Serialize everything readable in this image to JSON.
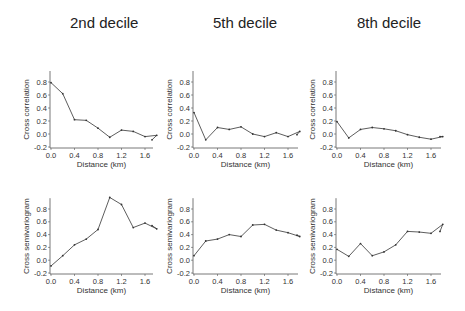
{
  "figure": {
    "column_titles": [
      "2nd decile",
      "5th decile",
      "8th decile"
    ],
    "colors": {
      "line": "#333333",
      "axis": "#555555",
      "text": "#222222"
    }
  },
  "chart_data": [
    {
      "type": "line",
      "title": "2nd decile",
      "xlabel": "Distance (km)",
      "ylabel": "Cross correlation",
      "x": [
        0.0,
        0.2,
        0.4,
        0.6,
        0.8,
        1.0,
        1.2,
        1.4,
        1.6,
        1.8,
        2.0
      ],
      "values": [
        0.79,
        0.62,
        0.22,
        0.21,
        0.09,
        -0.05,
        0.06,
        0.04,
        -0.04,
        -0.02,
        -0.09
      ],
      "xticks": [
        "0.0",
        "0.4",
        "0.8",
        "1.2",
        "1.6"
      ],
      "yticks": [
        "-0.2",
        "0.0",
        "0.2",
        "0.4",
        "0.6",
        "0.8"
      ],
      "xlim": [
        0.0,
        2.0
      ],
      "ylim": [
        -0.2,
        1.0
      ],
      "grid": false
    },
    {
      "type": "line",
      "title": "5th decile",
      "xlabel": "Distance (km)",
      "ylabel": "Cross correlation",
      "x": [
        0.0,
        0.2,
        0.4,
        0.6,
        0.8,
        1.0,
        1.2,
        1.4,
        1.6,
        1.8,
        2.0
      ],
      "values": [
        0.33,
        -0.09,
        0.1,
        0.07,
        0.11,
        0.0,
        -0.04,
        0.02,
        -0.04,
        0.04,
        -0.01
      ],
      "xticks": [
        "0.0",
        "0.4",
        "0.8",
        "1.2",
        "1.6"
      ],
      "yticks": [
        "-0.2",
        "0.0",
        "0.2",
        "0.4",
        "0.6",
        "0.8"
      ],
      "xlim": [
        0.0,
        2.0
      ],
      "ylim": [
        -0.2,
        1.0
      ],
      "grid": false
    },
    {
      "type": "line",
      "title": "8th decile",
      "xlabel": "Distance (km)",
      "ylabel": "Cross correlation",
      "x": [
        0.0,
        0.2,
        0.4,
        0.6,
        0.8,
        1.0,
        1.2,
        1.4,
        1.6,
        1.8,
        2.0
      ],
      "values": [
        0.19,
        -0.06,
        0.07,
        0.1,
        0.08,
        0.05,
        -0.01,
        -0.05,
        -0.08,
        -0.04,
        -0.04
      ],
      "xticks": [
        "0.0",
        "0.4",
        "0.8",
        "1.2",
        "1.6"
      ],
      "yticks": [
        "-0.2",
        "0.0",
        "0.2",
        "0.4",
        "0.6",
        "0.8"
      ],
      "xlim": [
        0.0,
        2.0
      ],
      "ylim": [
        -0.2,
        1.0
      ],
      "grid": false
    },
    {
      "type": "line",
      "title": "2nd decile",
      "xlabel": "Distance (km)",
      "ylabel": "Cross semivariogram",
      "x": [
        0.0,
        0.2,
        0.4,
        0.6,
        0.8,
        1.0,
        1.2,
        1.4,
        1.6,
        1.8,
        2.0
      ],
      "values": [
        -0.09,
        0.07,
        0.24,
        0.33,
        0.48,
        0.98,
        0.87,
        0.51,
        0.58,
        0.49,
        0.54
      ],
      "xticks": [
        "0.0",
        "0.4",
        "0.8",
        "1.2",
        "1.6"
      ],
      "yticks": [
        "-0.2",
        "0.0",
        "0.2",
        "0.4",
        "0.6",
        "0.8"
      ],
      "xlim": [
        0.0,
        2.0
      ],
      "ylim": [
        -0.2,
        1.0
      ],
      "grid": false
    },
    {
      "type": "line",
      "title": "5th decile",
      "xlabel": "Distance (km)",
      "ylabel": "Cross semivariogram",
      "x": [
        0.0,
        0.2,
        0.4,
        0.6,
        0.8,
        1.0,
        1.2,
        1.4,
        1.6,
        1.8,
        2.0
      ],
      "values": [
        0.07,
        0.3,
        0.33,
        0.4,
        0.37,
        0.55,
        0.56,
        0.47,
        0.43,
        0.37,
        0.39
      ],
      "xticks": [
        "0.0",
        "0.4",
        "0.8",
        "1.2",
        "1.6"
      ],
      "yticks": [
        "-0.2",
        "0.0",
        "0.2",
        "0.4",
        "0.6",
        "0.8"
      ],
      "xlim": [
        0.0,
        2.0
      ],
      "ylim": [
        -0.2,
        1.0
      ],
      "grid": false
    },
    {
      "type": "line",
      "title": "8th decile",
      "xlabel": "Distance (km)",
      "ylabel": "Cross semivariogram",
      "x": [
        0.0,
        0.2,
        0.4,
        0.6,
        0.8,
        1.0,
        1.2,
        1.4,
        1.6,
        1.8,
        2.0
      ],
      "values": [
        0.17,
        0.06,
        0.26,
        0.07,
        0.13,
        0.24,
        0.45,
        0.44,
        0.42,
        0.56,
        0.45
      ],
      "xticks": [
        "0.0",
        "0.4",
        "0.8",
        "1.2",
        "1.6"
      ],
      "yticks": [
        "-0.2",
        "0.0",
        "0.2",
        "0.4",
        "0.6",
        "0.8"
      ],
      "xlim": [
        0.0,
        2.0
      ],
      "ylim": [
        -0.2,
        1.0
      ],
      "grid": false
    }
  ]
}
